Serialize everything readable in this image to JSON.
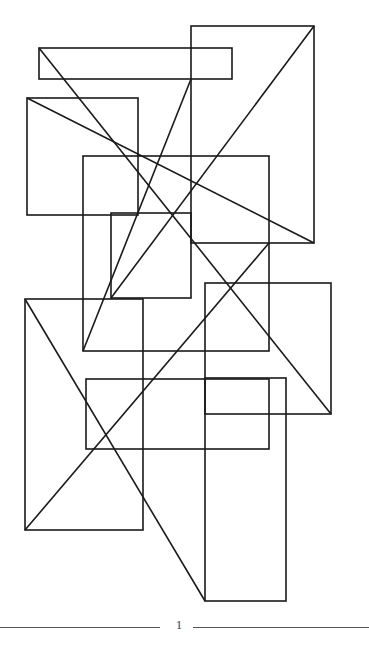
{
  "figure": {
    "stroke_color": "#1a1a1a",
    "stroke_width": 1.6,
    "rectangles": [
      {
        "name": "top-bar",
        "x": 39,
        "y": 48,
        "w": 193,
        "h": 31
      },
      {
        "name": "right-tall",
        "x": 191,
        "y": 26,
        "w": 123,
        "h": 217
      },
      {
        "name": "left-upper",
        "x": 27,
        "y": 98,
        "w": 111,
        "h": 117
      },
      {
        "name": "middle",
        "x": 83,
        "y": 156,
        "w": 186,
        "h": 195
      },
      {
        "name": "small-center",
        "x": 111,
        "y": 213,
        "w": 80,
        "h": 85
      },
      {
        "name": "left-lower",
        "x": 25,
        "y": 299,
        "w": 118,
        "h": 231
      },
      {
        "name": "right-middle",
        "x": 205,
        "y": 283,
        "w": 126,
        "h": 131
      },
      {
        "name": "lower-wide",
        "x": 86,
        "y": 379,
        "w": 183,
        "h": 70
      },
      {
        "name": "bottom-tall",
        "x": 205,
        "y": 378,
        "w": 81,
        "h": 223
      }
    ],
    "diagonals": [
      {
        "x1": 39,
        "y1": 48,
        "x2": 331,
        "y2": 414
      },
      {
        "x1": 314,
        "y1": 26,
        "x2": 111,
        "y2": 298
      },
      {
        "x1": 191,
        "y1": 79,
        "x2": 83,
        "y2": 351
      },
      {
        "x1": 27,
        "y1": 98,
        "x2": 314,
        "y2": 243
      },
      {
        "x1": 269,
        "y1": 243,
        "x2": 25,
        "y2": 530
      },
      {
        "x1": 25,
        "y1": 299,
        "x2": 205,
        "y2": 601
      }
    ]
  },
  "footer": {
    "page_number": "1"
  }
}
